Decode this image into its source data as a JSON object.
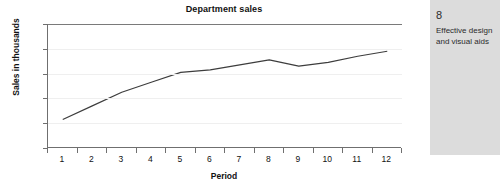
{
  "chart_data": {
    "type": "line",
    "title": "Department sales",
    "xlabel": "Period",
    "ylabel": "Sales in thousands",
    "categories": [
      "1",
      "2",
      "3",
      "4",
      "5",
      "6",
      "7",
      "8",
      "9",
      "10",
      "11",
      "12"
    ],
    "values": [
      23,
      34,
      45,
      53,
      61,
      63,
      67,
      71,
      66,
      69,
      74,
      78
    ],
    "series": [
      {
        "name": "Department sales",
        "values": [
          23,
          34,
          45,
          53,
          61,
          63,
          67,
          71,
          66,
          69,
          74,
          78
        ],
        "color": "#3d3d3d"
      }
    ],
    "ylim": [
      0,
      100
    ],
    "y_ticks": [
      "0",
      "20",
      "40",
      "60",
      "80",
      "100"
    ],
    "x_ticks": [
      "1",
      "2",
      "3",
      "4",
      "5",
      "6",
      "7",
      "8",
      "9",
      "10",
      "11",
      "12"
    ],
    "grid": true,
    "legend": "none",
    "grid_color": "#efefef",
    "axis_color": "#6f6f6f"
  },
  "info_panel": {
    "number": "8",
    "caption": "Effective design and visual aids",
    "background": "#dcdcdc"
  }
}
